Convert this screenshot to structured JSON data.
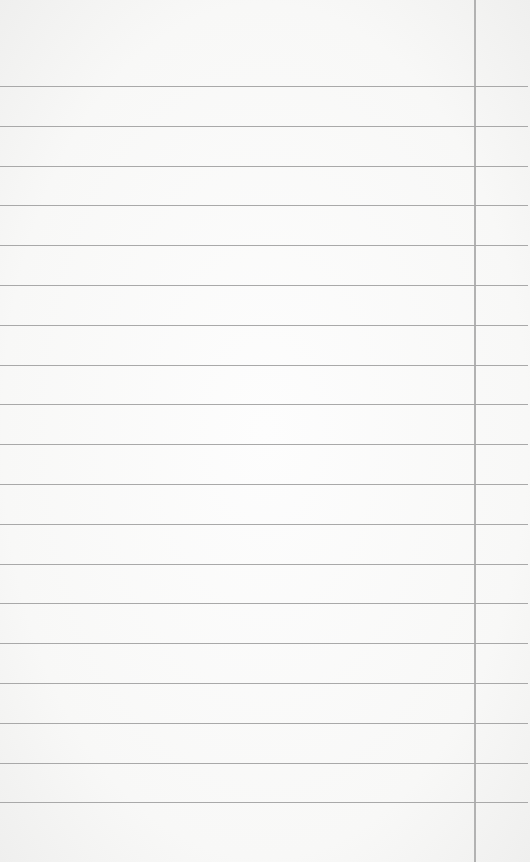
{
  "paper": {
    "type": "lined-notepad",
    "background_color": "#f8f8f7",
    "rule_color": "#a9a9a9",
    "margin_line_color": "#b2b2b2",
    "rule_count": 19,
    "first_rule_y": 86,
    "rule_spacing": 39.8,
    "margin_line_x": 474
  }
}
